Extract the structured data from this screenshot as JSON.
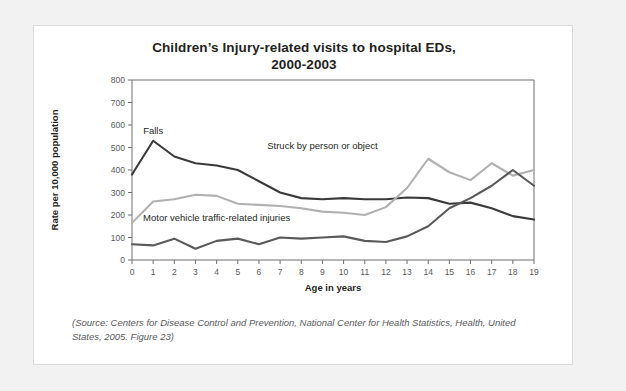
{
  "figure": {
    "title_line1": "Children’s Injury-related visits to hospital EDs,",
    "title_line2": "2000-2003",
    "caption": "(Source: Centers for Disease Control and Prevention, National Center for Health Statistics, Health, United States, 2005. Figure 23)"
  },
  "chart_data": {
    "type": "line",
    "title": "Children’s Injury-related visits to hospital EDs, 2000-2003",
    "xlabel": "Age in years",
    "ylabel": "Rate per 10,000 population",
    "xlim": [
      0,
      19
    ],
    "ylim": [
      0,
      800
    ],
    "ytick_step": 100,
    "grid": false,
    "legend_position": "inline-annotations",
    "x": [
      0,
      1,
      2,
      3,
      4,
      5,
      6,
      7,
      8,
      9,
      10,
      11,
      12,
      13,
      14,
      15,
      16,
      17,
      18,
      19
    ],
    "xticklabels": [
      "0",
      "1",
      "2",
      "3",
      "4",
      "5",
      "6",
      "7",
      "8",
      "9",
      "10",
      "11",
      "12",
      "13",
      "14",
      "15",
      "16",
      "17",
      "18",
      "19"
    ],
    "yticklabels": [
      "0",
      "100",
      "200",
      "300",
      "400",
      "500",
      "600",
      "700",
      "800"
    ],
    "series": [
      {
        "name": "Falls",
        "color": "#3a3a3c",
        "label_x": 1,
        "label_y": 560,
        "values": [
          380,
          530,
          460,
          430,
          420,
          400,
          350,
          300,
          275,
          270,
          275,
          270,
          270,
          278,
          275,
          250,
          255,
          230,
          195,
          180
        ]
      },
      {
        "name": "Struck by person or object",
        "color": "#b0b0b0",
        "label_x": 9,
        "label_y": 495,
        "values": [
          165,
          260,
          270,
          290,
          285,
          250,
          245,
          240,
          230,
          215,
          210,
          200,
          235,
          320,
          450,
          390,
          355,
          430,
          375,
          400
        ]
      },
      {
        "name": "Motor vehicle traffic-related injuries",
        "color": "#58595b",
        "label_x": 4,
        "label_y": 175,
        "values": [
          70,
          65,
          95,
          50,
          85,
          95,
          70,
          100,
          95,
          100,
          105,
          85,
          80,
          105,
          150,
          230,
          275,
          330,
          400,
          330
        ]
      }
    ]
  },
  "annotations": {
    "falls_label": "Falls",
    "struck_label": "Struck by person or object",
    "motor_label": "Motor vehicle traffic-related injuries"
  }
}
